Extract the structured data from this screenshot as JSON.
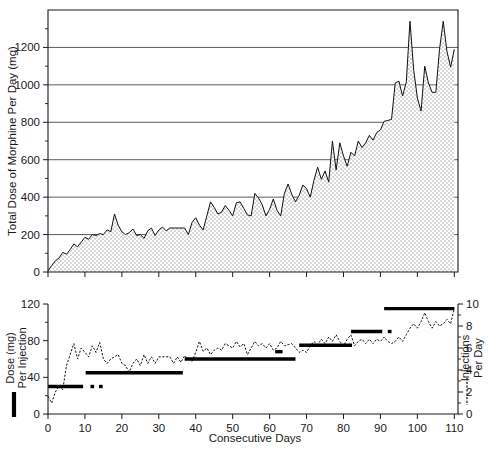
{
  "figure": {
    "background": "#ffffff",
    "ink_color": "#111111",
    "fill_color": "#e8e8e8"
  },
  "chart_data": [
    {
      "type": "area",
      "panel": "top",
      "title": "",
      "xlabel": "",
      "ylabel": "Total Dose of Morphine Per Day (mg)",
      "xlim": [
        0,
        111
      ],
      "ylim": [
        0,
        1400
      ],
      "grid": true,
      "grid_axis": "y",
      "legend_position": "none",
      "yticks": [
        0,
        200,
        400,
        600,
        800,
        1000,
        1200
      ],
      "ytick_labels": [
        "0",
        "200",
        "400",
        "600",
        "800",
        "1000",
        "1200"
      ],
      "xticks": [
        0,
        10,
        20,
        30,
        40,
        50,
        60,
        70,
        80,
        90,
        100,
        110
      ],
      "xtick_labels": [
        "",
        "",
        "",
        "",
        "",
        "",
        "",
        "",
        "",
        "",
        "",
        ""
      ],
      "series": [
        {
          "name": "Total Dose of Morphine Per Day (mg)",
          "style": "solid-line-filled",
          "x": [
            0,
            1,
            2,
            3,
            4,
            5,
            6,
            7,
            8,
            9,
            10,
            11,
            12,
            13,
            14,
            15,
            16,
            17,
            18,
            19,
            20,
            21,
            22,
            23,
            24,
            25,
            26,
            27,
            28,
            29,
            30,
            31,
            32,
            33,
            34,
            35,
            36,
            37,
            38,
            39,
            40,
            41,
            42,
            43,
            44,
            45,
            46,
            47,
            48,
            49,
            50,
            51,
            52,
            53,
            54,
            55,
            56,
            57,
            58,
            59,
            60,
            61,
            62,
            63,
            64,
            65,
            66,
            67,
            68,
            69,
            70,
            71,
            72,
            73,
            74,
            75,
            76,
            77,
            78,
            79,
            80,
            81,
            82,
            83,
            84,
            85,
            86,
            87,
            88,
            89,
            90,
            91,
            92,
            93,
            94,
            95,
            96,
            97,
            98,
            99,
            100,
            101,
            102,
            103,
            104,
            105,
            106,
            107,
            108,
            109,
            110
          ],
          "values": [
            5,
            35,
            60,
            75,
            105,
            95,
            120,
            150,
            135,
            160,
            185,
            175,
            200,
            195,
            205,
            200,
            225,
            215,
            310,
            250,
            215,
            200,
            210,
            230,
            195,
            200,
            180,
            220,
            235,
            195,
            225,
            240,
            220,
            235,
            235,
            235,
            235,
            235,
            200,
            265,
            290,
            250,
            225,
            300,
            375,
            345,
            310,
            320,
            355,
            330,
            300,
            370,
            375,
            340,
            305,
            300,
            420,
            395,
            360,
            300,
            335,
            390,
            330,
            300,
            420,
            470,
            415,
            375,
            410,
            465,
            445,
            400,
            490,
            560,
            495,
            540,
            480,
            700,
            545,
            690,
            620,
            565,
            640,
            620,
            700,
            665,
            690,
            730,
            705,
            745,
            760,
            805,
            810,
            815,
            1010,
            1020,
            940,
            1015,
            1340,
            1080,
            930,
            860,
            1100,
            1010,
            960,
            960,
            1190,
            1340,
            1180,
            1095,
            1190
          ]
        }
      ]
    },
    {
      "type": "line",
      "panel": "bottom",
      "title": "",
      "xlabel": "Consecutive Days",
      "ylabel": "Dose (mg) Per Injection",
      "ylabel_right": "Injections Per Day",
      "xlim": [
        0,
        111
      ],
      "ylim": [
        0,
        120
      ],
      "ylim_right": [
        0,
        10
      ],
      "grid": false,
      "legend_position": "axis-labels",
      "yticks": [
        0,
        40,
        80,
        120
      ],
      "ytick_labels": [
        "0",
        "40",
        "80",
        "120"
      ],
      "yticks_minor": [
        20,
        60,
        100
      ],
      "yticks_right": [
        0,
        2,
        4,
        6,
        8,
        10
      ],
      "ytick_labels_right": [
        "0",
        "2",
        "4",
        "6",
        "8",
        "10"
      ],
      "yticks_right_minor": [
        1,
        3,
        5,
        7,
        9
      ],
      "xticks": [
        0,
        10,
        20,
        30,
        40,
        50,
        60,
        70,
        80,
        90,
        100,
        110
      ],
      "xtick_labels": [
        "0",
        "10",
        "20",
        "30",
        "40",
        "50",
        "60",
        "70",
        "80",
        "90",
        "100",
        "110"
      ],
      "series": [
        {
          "name": "Injections Per Day",
          "style": "dashed",
          "axis": "right",
          "x": [
            0,
            1,
            2,
            3,
            4,
            5,
            6,
            7,
            8,
            9,
            10,
            11,
            12,
            13,
            14,
            15,
            16,
            17,
            18,
            19,
            20,
            21,
            22,
            23,
            24,
            25,
            26,
            27,
            28,
            29,
            30,
            31,
            32,
            33,
            34,
            35,
            36,
            37,
            38,
            39,
            40,
            41,
            42,
            43,
            44,
            45,
            46,
            47,
            48,
            49,
            50,
            51,
            52,
            53,
            54,
            55,
            56,
            57,
            58,
            59,
            60,
            61,
            62,
            63,
            64,
            65,
            66,
            67,
            68,
            69,
            70,
            71,
            72,
            73,
            74,
            75,
            76,
            77,
            78,
            79,
            80,
            81,
            82,
            83,
            84,
            85,
            86,
            87,
            88,
            89,
            90,
            91,
            92,
            93,
            94,
            95,
            96,
            97,
            98,
            99,
            100,
            101,
            102,
            103,
            104,
            105,
            106,
            107,
            108,
            109,
            110
          ],
          "values": [
            1.6,
            1.0,
            2.0,
            2.6,
            2.2,
            4.4,
            5.4,
            6.4,
            5.0,
            6.0,
            5.6,
            5.2,
            6.2,
            5.6,
            6.5,
            5.0,
            4.6,
            5.0,
            5.2,
            5.4,
            4.6,
            4.4,
            3.8,
            4.6,
            5.0,
            4.4,
            5.4,
            4.6,
            5.2,
            4.6,
            5.2,
            5.2,
            5.2,
            5.2,
            4.6,
            5.2,
            4.7,
            5.3,
            5.0,
            4.8,
            5.6,
            6.6,
            5.7,
            6.0,
            5.4,
            5.8,
            6.0,
            5.8,
            6.4,
            6.2,
            6.0,
            6.6,
            6.1,
            6.4,
            5.4,
            6.0,
            6.6,
            6.2,
            6.4,
            6.0,
            6.4,
            5.8,
            6.0,
            6.6,
            6.2,
            6.3,
            6.4,
            6.0,
            5.6,
            5.8,
            5.6,
            6.2,
            6.6,
            6.3,
            6.8,
            6.4,
            7.0,
            6.6,
            7.2,
            6.6,
            6.2,
            6.8,
            7.2,
            6.2,
            6.6,
            6.8,
            6.4,
            6.8,
            6.4,
            6.8,
            6.6,
            7.0,
            6.6,
            6.4,
            6.6,
            7.0,
            6.6,
            7.2,
            7.8,
            8.2,
            7.8,
            8.4,
            9.2,
            8.4,
            7.8,
            8.4,
            8.0,
            8.2,
            8.6,
            8.2,
            9.6
          ]
        },
        {
          "name": "Dose (mg) Per Injection",
          "style": "solid-step-bars",
          "axis": "left",
          "segments": [
            {
              "x_start": 0,
              "x_end": 9.5,
              "value": 30
            },
            {
              "x_start": 11.5,
              "x_end": 12.5,
              "value": 30
            },
            {
              "x_start": 13.8,
              "x_end": 14.8,
              "value": 30
            },
            {
              "x_start": 10.2,
              "x_end": 36.5,
              "value": 45
            },
            {
              "x_start": 37.0,
              "x_end": 67.0,
              "value": 60
            },
            {
              "x_start": 61.5,
              "x_end": 63.5,
              "value": 68
            },
            {
              "x_start": 68.0,
              "x_end": 82.3,
              "value": 75
            },
            {
              "x_start": 82.0,
              "x_end": 90.5,
              "value": 90
            },
            {
              "x_start": 92.0,
              "x_end": 93.0,
              "value": 90
            },
            {
              "x_start": 91.0,
              "x_end": 110.0,
              "value": 115
            }
          ]
        }
      ]
    }
  ]
}
